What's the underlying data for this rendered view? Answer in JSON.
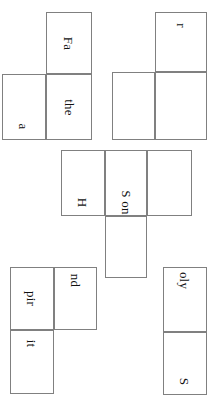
{
  "document": {
    "title": "Trinity shield word puzzle pieces",
    "orientation": "rotated-90-clockwise",
    "background_color": "#ffffff",
    "cell_border_color": "#808080",
    "text_color": "#111111",
    "canvas": {
      "width": 220,
      "height": 412
    }
  },
  "pieces": [
    {
      "id": "piece-father",
      "name": "father-piece",
      "cells": [
        {
          "label": "Fa",
          "x": 46,
          "y": 12,
          "w": 46,
          "h": 62,
          "align": "center"
        },
        {
          "label": "the",
          "x": 46,
          "y": 74,
          "w": 46,
          "h": 66,
          "align": "center"
        },
        {
          "label": "a",
          "x": 2,
          "y": 74,
          "w": 44,
          "h": 66,
          "align": "end"
        }
      ]
    },
    {
      "id": "piece-r",
      "name": "r-piece",
      "cells": [
        {
          "label": "r",
          "x": 155,
          "y": 12,
          "w": 52,
          "h": 60,
          "align": "start"
        },
        {
          "label": "",
          "x": 155,
          "y": 72,
          "w": 52,
          "h": 68,
          "align": "center"
        },
        {
          "label": "",
          "x": 112,
          "y": 72,
          "w": 43,
          "h": 68,
          "align": "center"
        }
      ]
    },
    {
      "id": "piece-hson",
      "name": "h-son-piece",
      "cells": [
        {
          "label": "H",
          "x": 61,
          "y": 150,
          "w": 44,
          "h": 66,
          "align": "end"
        },
        {
          "label": "S on",
          "x": 105,
          "y": 150,
          "w": 42,
          "h": 66,
          "align": "end"
        },
        {
          "label": "",
          "x": 147,
          "y": 150,
          "w": 45,
          "h": 66,
          "align": "center"
        },
        {
          "label": "",
          "x": 105,
          "y": 216,
          "w": 42,
          "h": 62,
          "align": "center"
        }
      ]
    },
    {
      "id": "piece-spirit",
      "name": "spirit-piece",
      "cells": [
        {
          "label": "nd",
          "x": 54,
          "y": 267,
          "w": 43,
          "h": 63,
          "align": "start"
        },
        {
          "label": "pir",
          "x": 10,
          "y": 267,
          "w": 44,
          "h": 63,
          "align": "center"
        },
        {
          "label": "it",
          "x": 10,
          "y": 330,
          "w": 44,
          "h": 64,
          "align": "start"
        }
      ]
    },
    {
      "id": "piece-olys",
      "name": "oly-s-piece",
      "cells": [
        {
          "label": "oly",
          "x": 163,
          "y": 267,
          "w": 44,
          "h": 65,
          "align": "start"
        },
        {
          "label": "S",
          "x": 163,
          "y": 332,
          "w": 44,
          "h": 63,
          "align": "end"
        }
      ]
    }
  ]
}
